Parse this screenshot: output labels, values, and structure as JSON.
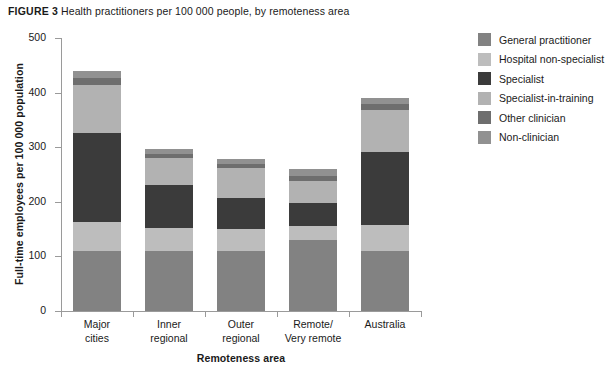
{
  "caption": {
    "figure_label": "FIGURE 3",
    "title": "Health practitioners per 100 000 people, by remoteness area"
  },
  "chart_data": {
    "type": "bar",
    "stacked": true,
    "title": "Health practitioners per 100 000 people, by remoteness area",
    "xlabel": "Remoteness area",
    "ylabel": "Full-time employees per 100 000 population",
    "ylim": [
      0,
      500
    ],
    "yticks": [
      0,
      100,
      200,
      300,
      400,
      500
    ],
    "ytick_labels": [
      "0",
      "100",
      "200",
      "300",
      "400",
      "500"
    ],
    "grid": false,
    "legend_position": "right",
    "categories": [
      "Major cities",
      "Inner regional",
      "Outer regional",
      "Remote/Very remote",
      "Australia"
    ],
    "category_lines": [
      [
        "Major",
        "cities"
      ],
      [
        "Inner",
        "regional"
      ],
      [
        "Outer",
        "regional"
      ],
      [
        "Remote/",
        "Very remote"
      ],
      [
        "Australia"
      ]
    ],
    "series": [
      {
        "name": "General practitioner",
        "color": "#828282",
        "values": [
          110,
          110,
          110,
          130,
          110
        ]
      },
      {
        "name": "Hospital non-specialist",
        "color": "#bdbdbd",
        "values": [
          53,
          42,
          40,
          25,
          48
        ]
      },
      {
        "name": "Specialist",
        "color": "#3b3b3b",
        "values": [
          163,
          78,
          57,
          43,
          133
        ]
      },
      {
        "name": "Specialist-in-training",
        "color": "#b2b2b2",
        "values": [
          88,
          50,
          55,
          40,
          78
        ]
      },
      {
        "name": "Other clinician",
        "color": "#6e6e6e",
        "values": [
          13,
          8,
          8,
          10,
          11
        ]
      },
      {
        "name": "Non-clinician",
        "color": "#919191",
        "values": [
          13,
          8,
          8,
          12,
          11
        ]
      }
    ],
    "totals": [
      440,
      296,
      278,
      260,
      391
    ]
  },
  "legend": {
    "items": [
      {
        "label": "General practitioner",
        "color": "#828282"
      },
      {
        "label": "Hospital non-specialist",
        "color": "#bdbdbd"
      },
      {
        "label": "Specialist",
        "color": "#3b3b3b"
      },
      {
        "label": "Specialist-in-training",
        "color": "#b2b2b2"
      },
      {
        "label": "Other clinician",
        "color": "#6e6e6e"
      },
      {
        "label": "Non-clinician",
        "color": "#919191"
      }
    ]
  }
}
